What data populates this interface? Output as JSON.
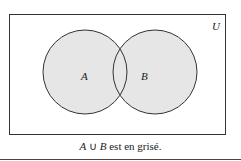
{
  "diagram": {
    "universe_label": "U",
    "set_a_label": "A",
    "set_b_label": "B",
    "fill_color": "#e6e6e6",
    "stroke_color": "#333333"
  },
  "caption": {
    "set_a": "A",
    "union_symbol": "∪",
    "set_b": "B",
    "text": "est en grisé."
  }
}
